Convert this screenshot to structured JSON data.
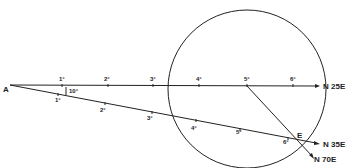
{
  "diagram": {
    "origin_label": "A",
    "angle_label": "10°",
    "intersection_label": "E",
    "ray_upper": {
      "bearing_label": "N 25E",
      "ticks": [
        "1°",
        "2°",
        "3°",
        "4°",
        "5°",
        "6°"
      ]
    },
    "ray_lower": {
      "bearing_label": "N 35E",
      "ticks": [
        "1°",
        "2°",
        "3°",
        "4°",
        "5°",
        "6°"
      ]
    },
    "ray_from_5": {
      "bearing_label": "N 70E"
    },
    "colors": {
      "line": "#222222",
      "background": "#ffffff"
    }
  }
}
